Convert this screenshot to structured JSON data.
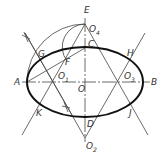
{
  "diagram": {
    "points": {
      "A": "A",
      "B": "B",
      "C": "C",
      "D": "D",
      "E": "E",
      "F": "F",
      "G": "G",
      "H": "H",
      "J": "J",
      "K": "K",
      "O": "O",
      "O1": "O",
      "O1_sub": "1",
      "O2": "O",
      "O2_sub": "2",
      "O3": "O",
      "O3_sub": "3",
      "O4": "O",
      "O4_sub": "4"
    },
    "colors": {
      "stroke": "#333333",
      "ellipse": "#111111",
      "background": "#ffffff"
    }
  }
}
